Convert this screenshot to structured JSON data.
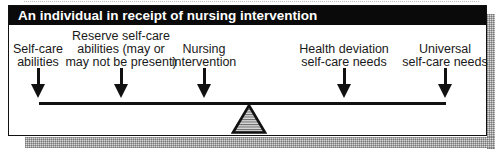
{
  "diagram": {
    "title": "An individual in receipt of nursing intervention",
    "type": "balance-scale",
    "labels": [
      {
        "id": "self-care-abilities",
        "lines": [
          "Self-care",
          "abilities"
        ],
        "arrow_x": 37
      },
      {
        "id": "reserve-self-care-abilities",
        "lines": [
          "Reserve self-care",
          "abilities (may or",
          "may not be present)"
        ],
        "arrow_x": 120
      },
      {
        "id": "nursing-intervention",
        "lines": [
          "Nursing",
          "intervention"
        ],
        "arrow_x": 203
      },
      {
        "id": "health-deviation-self-care-needs",
        "lines": [
          "Health deviation",
          "self-care needs"
        ],
        "arrow_x": 343
      },
      {
        "id": "universal-self-care-needs",
        "lines": [
          "Universal",
          "self-care needs"
        ],
        "arrow_x": 444
      }
    ],
    "beam": {
      "from_x": 38,
      "to_x": 445,
      "y": 102
    },
    "fulcrum": {
      "shape": "triangle",
      "fill": "hatched-gray",
      "center_x": 240
    },
    "colors": {
      "header_bg": "#0a0a0a",
      "header_text": "#ffffff",
      "line": "#111111",
      "shadow": "#bdbdbd"
    }
  }
}
